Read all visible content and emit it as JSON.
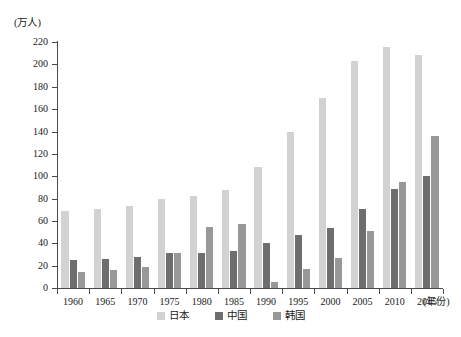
{
  "chart_data": {
    "type": "bar",
    "title": "",
    "xlabel": "(年份)",
    "ylabel": "(万人)",
    "ylim": [
      0,
      220
    ],
    "ytick_step": 20,
    "grid": false,
    "legend_position": "bottom-center",
    "categories": [
      "1960",
      "1965",
      "1970",
      "1975",
      "1980",
      "1985",
      "1990",
      "1995",
      "2000",
      "2005",
      "2010",
      "2015"
    ],
    "yticks": [
      "0",
      "20",
      "40",
      "60",
      "80",
      "100",
      "120",
      "140",
      "160",
      "180",
      "200",
      "220"
    ],
    "series": [
      {
        "name": "日本",
        "color": "#d2d2d2",
        "values": [
          69,
          71,
          73,
          80,
          82,
          88,
          108,
          140,
          170,
          203,
          216,
          208
        ]
      },
      {
        "name": "中国",
        "color": "#6e6e6e",
        "values": [
          25,
          26,
          28,
          31,
          31,
          33,
          40,
          47,
          54,
          71,
          89,
          100
        ]
      },
      {
        "name": "韩国",
        "color": "#989898",
        "values": [
          14,
          16,
          19,
          31,
          55,
          57,
          5,
          17,
          27,
          51,
          95,
          136
        ]
      }
    ]
  },
  "axis": {
    "y_unit_label": "(万人)",
    "x_unit_label": "(年份)"
  },
  "colors": {
    "axis": "#4a4a4a",
    "text": "#1a1a1a",
    "background": "#ffffff",
    "japan": "#d2d2d2",
    "china": "#6e6e6e",
    "korea": "#989898"
  }
}
